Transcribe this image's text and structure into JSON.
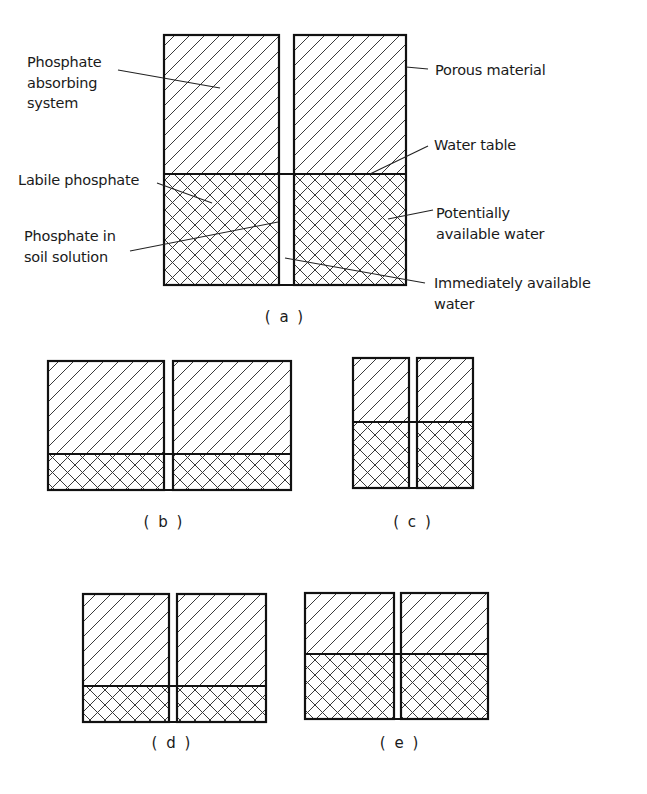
{
  "figure": {
    "colors": {
      "ink": "#111111",
      "hatch": "#3a3a3a",
      "background": "#ffffff"
    },
    "hatch_legend": {
      "single_hatch": "Porous material above water table (phosphate absorbing system)",
      "cross_hatch": "Below water table (labile phosphate / potentially available water)",
      "gap": "Immediately available water / phosphate in soil solution"
    },
    "panels": [
      {
        "id": "a",
        "caption": "( a )",
        "left_box": {
          "x": 164,
          "y": 35,
          "w": 115,
          "h": 250
        },
        "right_box": {
          "x": 294,
          "y": 35,
          "w": 112,
          "h": 250
        },
        "water_table_y": 174,
        "caption_pos": {
          "x": 285,
          "y": 322
        }
      },
      {
        "id": "b",
        "caption": "( b )",
        "left_box": {
          "x": 48,
          "y": 361,
          "w": 116,
          "h": 129
        },
        "right_box": {
          "x": 173,
          "y": 361,
          "w": 118,
          "h": 129
        },
        "water_table_y": 454,
        "caption_pos": {
          "x": 164,
          "y": 527
        }
      },
      {
        "id": "c",
        "caption": "( c )",
        "left_box": {
          "x": 353,
          "y": 358,
          "w": 56,
          "h": 130
        },
        "right_box": {
          "x": 417,
          "y": 358,
          "w": 56,
          "h": 130
        },
        "water_table_y": 422,
        "caption_pos": {
          "x": 413,
          "y": 527
        }
      },
      {
        "id": "d",
        "caption": "( d )",
        "left_box": {
          "x": 83,
          "y": 594,
          "w": 86,
          "h": 128
        },
        "right_box": {
          "x": 177,
          "y": 594,
          "w": 89,
          "h": 128
        },
        "water_table_y": 686,
        "caption_pos": {
          "x": 172,
          "y": 748
        }
      },
      {
        "id": "e",
        "caption": "( e )",
        "left_box": {
          "x": 305,
          "y": 593,
          "w": 89,
          "h": 126
        },
        "right_box": {
          "x": 401,
          "y": 593,
          "w": 87,
          "h": 126
        },
        "water_table_y": 654,
        "caption_pos": {
          "x": 400,
          "y": 748
        }
      }
    ],
    "annotations": {
      "phosphate_absorbing_system": {
        "lines": [
          "Phosphate",
          "absorbing",
          "system"
        ],
        "x": 27,
        "y": 67
      },
      "labile_phosphate": {
        "lines": [
          "Labile phosphate"
        ],
        "x": 18,
        "y": 185
      },
      "phosphate_in_soil_solution": {
        "lines": [
          "Phosphate in",
          "soil solution"
        ],
        "x": 24,
        "y": 241
      },
      "porous_material": {
        "lines": [
          "Porous material"
        ],
        "x": 435,
        "y": 75
      },
      "water_table": {
        "lines": [
          "Water table"
        ],
        "x": 434,
        "y": 150
      },
      "potentially_available_water": {
        "lines": [
          "Potentially",
          "available water"
        ],
        "x": 436,
        "y": 218
      },
      "immediately_available_water": {
        "lines": [
          "Immediately available",
          "water"
        ],
        "x": 434,
        "y": 288
      }
    }
  }
}
